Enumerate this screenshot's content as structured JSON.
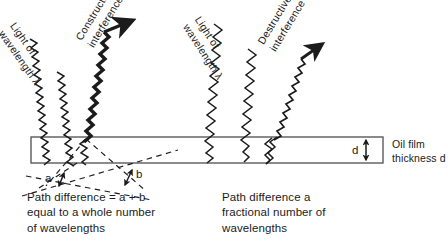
{
  "diagram": {
    "stroke_color": "#1b1b1b",
    "film_fill": "#ffffff",
    "left_side": {
      "incoming_label_line1": "Light of",
      "incoming_label_line2": "wavelength λ",
      "outgoing_label_line1": "Constructive",
      "outgoing_label_line2": "interference",
      "caption_line1": "Path difference = a + b",
      "caption_line2": "equal to a whole number",
      "caption_line3": "of wavelengths",
      "segment_a_label": "a",
      "segment_b_label": "b"
    },
    "right_side": {
      "incoming_label_line1": "Light of",
      "incoming_label_line2": "wavelength λ",
      "outgoing_label_line1": "Destructive",
      "outgoing_label_line2": "interference",
      "caption_line1": "Path difference a",
      "caption_line2": "fractional number of",
      "caption_line3": "wavelengths"
    },
    "film": {
      "thickness_letter": "d",
      "label_line1": "Oil film",
      "label_line2": "thickness d"
    }
  }
}
